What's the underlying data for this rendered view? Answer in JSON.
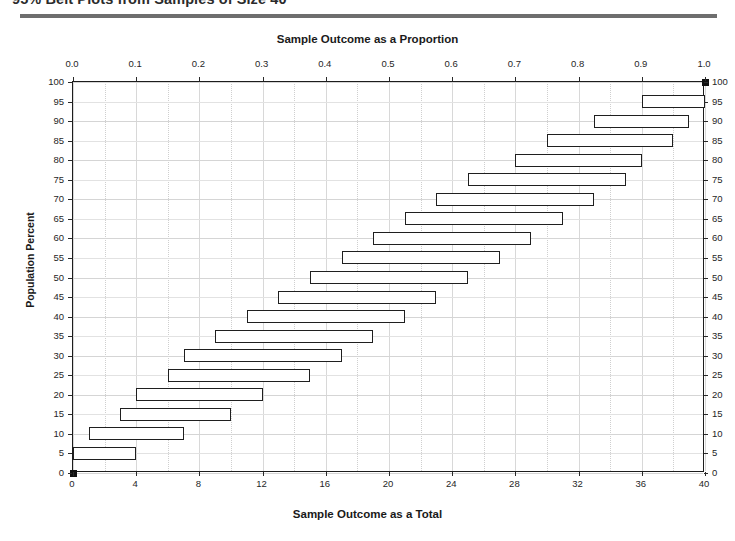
{
  "figure": {
    "title": "95% Belt Plots from Samples of Size 40",
    "top_axis_title": "Sample Outcome as a Proportion",
    "bottom_axis_title": "Sample Outcome as a  Total",
    "left_axis_title": "Population Percent"
  },
  "chart_data": {
    "type": "bar",
    "orientation": "horizontal",
    "title": "95% Belt Plots from Samples of Size 40",
    "xlabel": "Sample Outcome as a  Total",
    "xlabel_top": "Sample Outcome as a Proportion",
    "ylabel": "Population Percent",
    "sample_size": 40,
    "confidence_level": "95%",
    "xlim": [
      0,
      40
    ],
    "ylim": [
      0,
      100
    ],
    "xlim_proportion": [
      0.0,
      1.0
    ],
    "grid": true,
    "legend": "none",
    "x_ticks_total": [
      0,
      4,
      8,
      12,
      16,
      20,
      24,
      28,
      32,
      36,
      40
    ],
    "x_tick_labels_total": [
      "0",
      "4",
      "8",
      "12",
      "16",
      "20",
      "24",
      "28",
      "32",
      "36",
      "40"
    ],
    "x_ticks_proportion": [
      0.0,
      0.1,
      0.2,
      0.3,
      0.4,
      0.5,
      0.6,
      0.7,
      0.8,
      0.9,
      1.0
    ],
    "x_tick_labels_proportion": [
      "0.0",
      "0.1",
      "0.2",
      "0.3",
      "0.4",
      "0.5",
      "0.6",
      "0.7",
      "0.8",
      "0.9",
      "1.0"
    ],
    "y_ticks": [
      0,
      5,
      10,
      15,
      20,
      25,
      30,
      35,
      40,
      45,
      50,
      55,
      60,
      65,
      70,
      75,
      80,
      85,
      90,
      95,
      100
    ],
    "y_tick_labels": [
      "0",
      "5",
      "10",
      "15",
      "20",
      "25",
      "30",
      "35",
      "40",
      "45",
      "50",
      "55",
      "60",
      "65",
      "70",
      "75",
      "80",
      "85",
      "90",
      "95",
      "100"
    ],
    "categories": [
      0,
      5,
      10,
      15,
      20,
      25,
      30,
      35,
      40,
      45,
      50,
      55,
      60,
      65,
      70,
      75,
      80,
      85,
      90,
      95,
      100
    ],
    "bars": [
      {
        "population_percent": 0,
        "low": 0,
        "high": 0,
        "low_prop": 0.0,
        "high_prop": 0.0,
        "style": "point"
      },
      {
        "population_percent": 5,
        "low": 0,
        "high": 4,
        "low_prop": 0.0,
        "high_prop": 0.1,
        "style": "interval"
      },
      {
        "population_percent": 10,
        "low": 1,
        "high": 7,
        "low_prop": 0.025,
        "high_prop": 0.175,
        "style": "interval"
      },
      {
        "population_percent": 15,
        "low": 3,
        "high": 10,
        "low_prop": 0.075,
        "high_prop": 0.25,
        "style": "interval"
      },
      {
        "population_percent": 20,
        "low": 4,
        "high": 12,
        "low_prop": 0.1,
        "high_prop": 0.3,
        "style": "interval"
      },
      {
        "population_percent": 25,
        "low": 6,
        "high": 15,
        "low_prop": 0.15,
        "high_prop": 0.375,
        "style": "interval"
      },
      {
        "population_percent": 30,
        "low": 7,
        "high": 17,
        "low_prop": 0.175,
        "high_prop": 0.425,
        "style": "interval"
      },
      {
        "population_percent": 35,
        "low": 9,
        "high": 19,
        "low_prop": 0.225,
        "high_prop": 0.475,
        "style": "interval"
      },
      {
        "population_percent": 40,
        "low": 11,
        "high": 21,
        "low_prop": 0.275,
        "high_prop": 0.525,
        "style": "interval"
      },
      {
        "population_percent": 45,
        "low": 13,
        "high": 23,
        "low_prop": 0.325,
        "high_prop": 0.575,
        "style": "interval"
      },
      {
        "population_percent": 50,
        "low": 15,
        "high": 25,
        "low_prop": 0.375,
        "high_prop": 0.625,
        "style": "interval"
      },
      {
        "population_percent": 55,
        "low": 17,
        "high": 27,
        "low_prop": 0.425,
        "high_prop": 0.675,
        "style": "interval"
      },
      {
        "population_percent": 60,
        "low": 19,
        "high": 29,
        "low_prop": 0.475,
        "high_prop": 0.725,
        "style": "interval"
      },
      {
        "population_percent": 65,
        "low": 21,
        "high": 31,
        "low_prop": 0.525,
        "high_prop": 0.775,
        "style": "interval"
      },
      {
        "population_percent": 70,
        "low": 23,
        "high": 33,
        "low_prop": 0.575,
        "high_prop": 0.825,
        "style": "interval"
      },
      {
        "population_percent": 75,
        "low": 25,
        "high": 35,
        "low_prop": 0.625,
        "high_prop": 0.875,
        "style": "interval"
      },
      {
        "population_percent": 80,
        "low": 28,
        "high": 36,
        "low_prop": 0.7,
        "high_prop": 0.9,
        "style": "interval"
      },
      {
        "population_percent": 85,
        "low": 30,
        "high": 38,
        "low_prop": 0.75,
        "high_prop": 0.95,
        "style": "interval"
      },
      {
        "population_percent": 90,
        "low": 33,
        "high": 39,
        "low_prop": 0.825,
        "high_prop": 0.975,
        "style": "interval"
      },
      {
        "population_percent": 95,
        "low": 36,
        "high": 40,
        "low_prop": 0.9,
        "high_prop": 1.0,
        "style": "interval"
      },
      {
        "population_percent": 100,
        "low": 40,
        "high": 40,
        "low_prop": 1.0,
        "high_prop": 1.0,
        "style": "point"
      }
    ],
    "colors": {
      "bar_stroke": "#1f1f1f",
      "bar_fill": "#ffffff",
      "point_fill": "#111111",
      "grid": "#d8d8d8",
      "frame": "#1d1d1d",
      "text": "#1a1a1a",
      "rule": "#6e6e6e"
    }
  }
}
